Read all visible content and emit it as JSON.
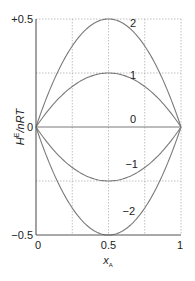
{
  "chart_data": {
    "type": "line",
    "title": "",
    "xlabel": "x_A",
    "xlabel_main": "x",
    "xlabel_sub": "A",
    "ylabel": "H^E/nRT",
    "ylabel_main": "H",
    "ylabel_sup": "E",
    "ylabel_rest": "/nRT",
    "xlim": [
      0,
      1
    ],
    "ylim": [
      -0.5,
      0.5
    ],
    "grid": true,
    "grid_x": [
      0.25,
      0.5,
      0.75,
      1.0
    ],
    "grid_y": [
      -0.25,
      0.25,
      0.5
    ],
    "x_ticks": [
      {
        "value": 0,
        "label": "0"
      },
      {
        "value": 0.5,
        "label": "0.5"
      },
      {
        "value": 1,
        "label": "1"
      }
    ],
    "y_ticks": [
      {
        "value": 0.5,
        "label": "+0.5"
      },
      {
        "value": 0,
        "label": "0"
      },
      {
        "value": -0.5,
        "label": "−0.5"
      }
    ],
    "formula": "H^E/nRT = A * x_A * (1 - x_A)",
    "x": [
      0,
      0.1,
      0.2,
      0.3,
      0.4,
      0.5,
      0.6,
      0.7,
      0.8,
      0.9,
      1.0
    ],
    "series": [
      {
        "name": "2",
        "label": "2",
        "A": 2,
        "values": [
          0,
          0.18,
          0.32,
          0.42,
          0.48,
          0.5,
          0.48,
          0.42,
          0.32,
          0.18,
          0
        ],
        "label_pos": [
          0.67,
          0.48
        ]
      },
      {
        "name": "1",
        "label": "1",
        "A": 1,
        "values": [
          0,
          0.09,
          0.16,
          0.21,
          0.24,
          0.25,
          0.24,
          0.21,
          0.16,
          0.09,
          0
        ],
        "label_pos": [
          0.67,
          0.24
        ]
      },
      {
        "name": "0",
        "label": "0",
        "A": 0,
        "values": [
          0,
          0,
          0,
          0,
          0,
          0,
          0,
          0,
          0,
          0,
          0
        ],
        "label_pos": [
          0.67,
          0.035
        ]
      },
      {
        "name": "-1",
        "label": "−1",
        "A": -1,
        "values": [
          0,
          -0.09,
          -0.16,
          -0.21,
          -0.24,
          -0.25,
          -0.24,
          -0.21,
          -0.16,
          -0.09,
          0
        ],
        "label_pos": [
          0.66,
          -0.17
        ]
      },
      {
        "name": "-2",
        "label": "−2",
        "A": -2,
        "values": [
          0,
          -0.18,
          -0.32,
          -0.42,
          -0.48,
          -0.5,
          -0.48,
          -0.42,
          -0.32,
          -0.18,
          0
        ],
        "label_pos": [
          0.64,
          -0.39
        ]
      }
    ],
    "colors": {
      "curve": "#7a7a7a",
      "axis": "#555555",
      "grid": "#b0b0b0",
      "text": "#222222"
    }
  }
}
